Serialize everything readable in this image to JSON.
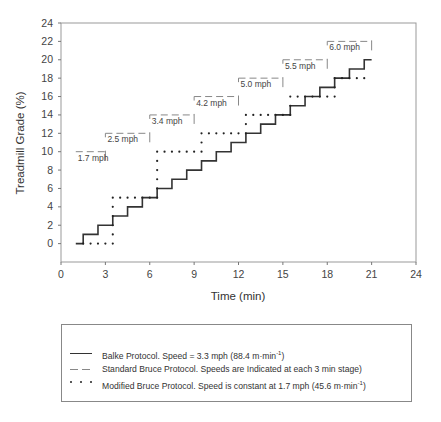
{
  "chart_data": {
    "type": "line",
    "title": "",
    "xlabel": "Time (min)",
    "ylabel": "Treadmill Grade (%)",
    "xlim": [
      0,
      24
    ],
    "ylim": [
      -2,
      24
    ],
    "xticks": [
      0,
      3,
      6,
      9,
      12,
      15,
      18,
      21,
      24
    ],
    "yticks": [
      0,
      2,
      4,
      6,
      8,
      10,
      12,
      14,
      16,
      18,
      20,
      22,
      24
    ],
    "grid": false,
    "legend_position": "below",
    "series": [
      {
        "name": "Balke Protocol",
        "style": "solid",
        "color": "#333333",
        "steps": [
          [
            1.0,
            1.5,
            0
          ],
          [
            1.5,
            2.5,
            1
          ],
          [
            2.5,
            3.5,
            2
          ],
          [
            3.5,
            4.5,
            3
          ],
          [
            4.5,
            5.5,
            4
          ],
          [
            5.5,
            6.5,
            5
          ],
          [
            6.5,
            7.5,
            6
          ],
          [
            7.5,
            8.5,
            7
          ],
          [
            8.5,
            9.5,
            8
          ],
          [
            9.5,
            10.5,
            9
          ],
          [
            10.5,
            11.5,
            10
          ],
          [
            11.5,
            12.5,
            11
          ],
          [
            12.5,
            13.5,
            12
          ],
          [
            13.5,
            14.5,
            13
          ],
          [
            14.5,
            15.5,
            14
          ],
          [
            15.5,
            16.5,
            15
          ],
          [
            16.5,
            17.5,
            16
          ],
          [
            17.5,
            18.5,
            17
          ],
          [
            18.5,
            19.5,
            18
          ],
          [
            19.5,
            20.5,
            19
          ],
          [
            20.5,
            21.0,
            20
          ]
        ]
      },
      {
        "name": "Standard Bruce Protocol",
        "style": "dashed",
        "color": "#888888",
        "steps": [
          [
            1,
            3,
            10
          ],
          [
            3,
            6,
            12
          ],
          [
            6,
            9,
            14
          ],
          [
            9,
            12,
            16
          ],
          [
            12,
            15,
            18
          ],
          [
            15,
            18,
            20
          ],
          [
            18,
            21,
            22
          ]
        ],
        "stage_labels": [
          {
            "t": 1.0,
            "g": 10,
            "text": "1.7 mph"
          },
          {
            "t": 3.0,
            "g": 12,
            "text": "2.5 mph"
          },
          {
            "t": 6.0,
            "g": 14,
            "text": "3.4 mph"
          },
          {
            "t": 9.0,
            "g": 16,
            "text": "4.2 mph"
          },
          {
            "t": 12.0,
            "g": 18,
            "text": "5.0 mph"
          },
          {
            "t": 15.0,
            "g": 20,
            "text": "5.5 mph"
          },
          {
            "t": 18.0,
            "g": 22,
            "text": "6.0 mph"
          }
        ]
      },
      {
        "name": "Modified Bruce Protocol",
        "style": "dotted",
        "color": "#222222",
        "steps": [
          [
            1.5,
            3.5,
            0
          ],
          [
            3.5,
            6.5,
            5
          ],
          [
            6.5,
            9.5,
            10
          ],
          [
            9.5,
            12.5,
            12
          ],
          [
            12.5,
            15.5,
            14
          ],
          [
            15.5,
            18.5,
            16
          ],
          [
            18.5,
            20.5,
            18
          ]
        ]
      }
    ]
  },
  "legend": {
    "items": [
      {
        "style": "solid",
        "label": "Balke Protocol.  Speed = 3.3 mph (88.4 m·min",
        "sup": "-1",
        "suffix": ")"
      },
      {
        "style": "dashed",
        "label": "Standard Bruce Protocol.  Speeds are Indicated at each 3 min stage)",
        "sup": "",
        "suffix": ""
      },
      {
        "style": "dotted",
        "label": "Modified Bruce Protocol.  Speed is constant at 1.7 mph (45.6 m·min",
        "sup": "-1",
        "suffix": ")"
      }
    ]
  }
}
